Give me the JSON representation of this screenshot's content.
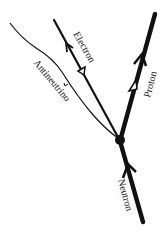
{
  "diagram": {
    "type": "feynman-diagram",
    "particles": [
      {
        "id": "neutron",
        "label": "Neutron"
      },
      {
        "id": "proton",
        "label": "Proton"
      },
      {
        "id": "electron",
        "label": "Electron"
      },
      {
        "id": "antineutrino",
        "label": "Antineutrino"
      }
    ],
    "colors": {
      "line": "#111111",
      "background": "#ffffff"
    }
  }
}
